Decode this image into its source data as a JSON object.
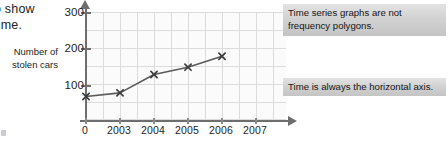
{
  "intro": {
    "line1": "o show",
    "line2": "time."
  },
  "y_caption": {
    "line1": "Number of",
    "line2": "stolen cars"
  },
  "callouts": [
    {
      "id": "frequency-polygons",
      "text": "Time series graphs are not frequency polygons."
    },
    {
      "id": "horizontal-axis",
      "text": "Time is always the horizontal axis."
    }
  ],
  "chart_data": {
    "type": "line",
    "title": "",
    "xlabel": "",
    "ylabel": "Number of stolen cars",
    "categories": [
      "2003",
      "2004",
      "2005",
      "2006",
      "2007"
    ],
    "values": [
      70,
      80,
      130,
      150,
      180
    ],
    "x_origin_label": "0",
    "x_tick_labels": [
      "0",
      "2003",
      "2004",
      "2005",
      "2006",
      "2007"
    ],
    "y_tick_labels": [
      "100",
      "200",
      "300"
    ],
    "y_ticks": [
      100,
      200,
      300
    ],
    "ylim": [
      0,
      310
    ],
    "grid": true,
    "legend": "none",
    "marker": "x",
    "line_color": "#5a5a5a",
    "marker_color": "#3c3c3c",
    "grid_color": "#dcdcdc",
    "axis_color": "#6e6e6e"
  }
}
